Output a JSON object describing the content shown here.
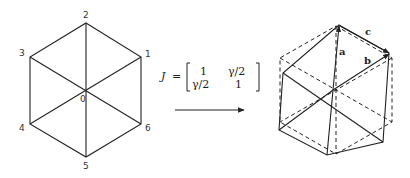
{
  "left_hexagon": {
    "vertex_labels": [
      "0",
      "1",
      "2",
      "3",
      "4",
      "5",
      "6"
    ]
  },
  "transform": {
    "lhs": "J",
    "equals": "=",
    "matrix": [
      [
        "1",
        "γ/2"
      ],
      [
        "γ/2",
        "1"
      ]
    ]
  },
  "right_hexagon": {
    "vector_labels": [
      "a",
      "b",
      "c"
    ]
  },
  "colors": {
    "line": "#222222",
    "background": "#ffffff"
  }
}
